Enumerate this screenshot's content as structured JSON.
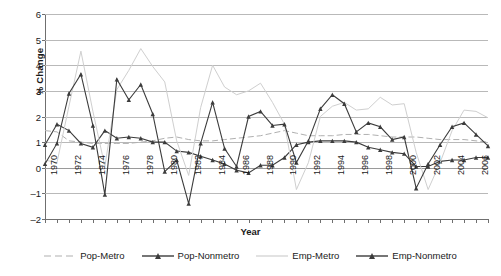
{
  "chart_data": {
    "type": "line",
    "title": "",
    "xlabel": "Year",
    "ylabel": "% Change",
    "ylim": [
      -2,
      6
    ],
    "yticks": [
      -2,
      -1,
      0,
      1,
      2,
      3,
      4,
      5,
      6
    ],
    "xlim": [
      1970,
      2007
    ],
    "grid": true,
    "legend_position": "bottom",
    "x": [
      1970,
      1971,
      1972,
      1973,
      1974,
      1975,
      1976,
      1977,
      1978,
      1979,
      1980,
      1981,
      1982,
      1983,
      1984,
      1985,
      1986,
      1987,
      1988,
      1989,
      1990,
      1991,
      1992,
      1993,
      1994,
      1995,
      1996,
      1997,
      1998,
      1999,
      2000,
      2001,
      2002,
      2003,
      2004,
      2005,
      2006,
      2007
    ],
    "xticklabels": [
      "1970",
      "1972",
      "1974",
      "1976",
      "1978",
      "1980",
      "1982",
      "1984",
      "1986",
      "1988",
      "1990",
      "1992",
      "1994",
      "1996",
      "1998",
      "2000",
      "2002",
      "2004",
      "2006"
    ],
    "series": [
      {
        "name": "Pop-Metro",
        "color": "#b0b0b0",
        "style": "dashed",
        "marker": "none",
        "values": [
          1.45,
          1.4,
          1.05,
          1.0,
          0.95,
          0.95,
          0.95,
          0.95,
          1.0,
          1.05,
          1.15,
          1.2,
          1.1,
          1.05,
          1.05,
          1.1,
          1.15,
          1.2,
          1.25,
          1.35,
          1.45,
          1.35,
          1.25,
          1.25,
          1.25,
          1.3,
          1.3,
          1.3,
          1.25,
          1.2,
          1.2,
          1.2,
          1.15,
          1.1,
          1.1,
          1.1,
          1.05,
          1.0
        ]
      },
      {
        "name": "Pop-Nonmetro",
        "color": "#3c3c3c",
        "style": "solid",
        "marker": "triangle",
        "values": [
          0.9,
          1.7,
          1.45,
          0.95,
          0.8,
          1.45,
          1.15,
          1.2,
          1.15,
          1.0,
          1.0,
          0.65,
          0.6,
          0.45,
          0.3,
          0.15,
          -0.1,
          -0.2,
          0.1,
          0.1,
          0.4,
          0.9,
          1.0,
          1.05,
          1.05,
          1.05,
          1.0,
          0.8,
          0.7,
          0.6,
          0.55,
          0.05,
          0.05,
          0.25,
          0.3,
          0.3,
          0.4,
          0.4
        ]
      },
      {
        "name": "Emp-Metro",
        "color": "#cfcfcf",
        "style": "solid",
        "marker": "none",
        "values": [
          0.3,
          0.2,
          2.4,
          4.55,
          2.2,
          0.05,
          3.05,
          3.8,
          4.65,
          3.95,
          3.35,
          1.05,
          -0.3,
          2.35,
          4.0,
          3.15,
          2.85,
          3.0,
          3.3,
          2.55,
          1.7,
          -0.85,
          0.2,
          2.0,
          2.4,
          2.55,
          2.25,
          2.3,
          2.75,
          2.45,
          2.5,
          0.6,
          -0.85,
          0.2,
          1.45,
          2.25,
          2.2,
          1.95
        ]
      },
      {
        "name": "Emp-Nonmetro",
        "color": "#3c3c3c",
        "style": "solid",
        "marker": "triangle",
        "values": [
          0.15,
          0.95,
          2.9,
          3.65,
          1.65,
          -1.05,
          3.45,
          2.65,
          3.25,
          2.1,
          -0.15,
          0.3,
          -1.4,
          0.95,
          2.55,
          0.75,
          0.05,
          2.0,
          2.2,
          1.65,
          1.7,
          0.2,
          1.05,
          2.3,
          2.85,
          2.5,
          1.4,
          1.75,
          1.6,
          1.1,
          1.2,
          -0.8,
          0.15,
          0.9,
          1.6,
          1.75,
          1.3,
          0.85
        ]
      }
    ]
  }
}
